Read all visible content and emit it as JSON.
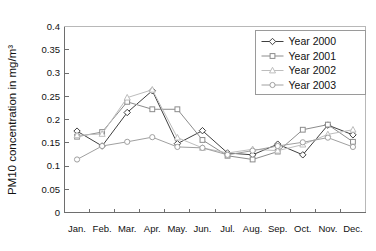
{
  "chart_data": {
    "type": "line",
    "title": "",
    "xlabel": "",
    "ylabel": "PM10 concentration in mg/m³",
    "categories": [
      "Jan.",
      "Feb.",
      "Mar.",
      "Apr.",
      "May.",
      "Jun.",
      "Jul.",
      "Aug.",
      "Sep.",
      "Oct.",
      "Nov.",
      "Dec."
    ],
    "ylim": [
      0,
      0.4
    ],
    "yticks": [
      0,
      0.05,
      0.1,
      0.15,
      0.2,
      0.25,
      0.3,
      0.35,
      0.4
    ],
    "ytick_labels": [
      "0",
      "0.05",
      "0.1",
      "0.15",
      "0.2",
      "0.25",
      "0.3",
      "0.35",
      "0.4"
    ],
    "grid": false,
    "legend_position": "top-right",
    "series": [
      {
        "name": "Year 2000",
        "marker": "diamond",
        "color": "#404040",
        "values": [
          0.175,
          0.143,
          0.215,
          0.262,
          0.148,
          0.176,
          0.128,
          0.124,
          0.147,
          0.124,
          0.188,
          0.167
        ]
      },
      {
        "name": "Year 2001",
        "marker": "square",
        "color": "#8c8c8c",
        "values": [
          0.163,
          0.173,
          0.238,
          0.222,
          0.222,
          0.156,
          0.122,
          0.114,
          0.131,
          0.178,
          0.189,
          0.152
        ]
      },
      {
        "name": "Year 2002",
        "marker": "triangle",
        "color": "#bdbdbd",
        "values": [
          0.166,
          0.169,
          0.247,
          0.264,
          0.161,
          0.139,
          0.128,
          0.136,
          0.133,
          0.146,
          0.168,
          0.178
        ]
      },
      {
        "name": "Year 2003",
        "marker": "circle",
        "color": "#a0a0a0",
        "values": [
          0.114,
          0.143,
          0.152,
          0.162,
          0.141,
          0.139,
          0.124,
          0.133,
          0.143,
          0.151,
          0.161,
          0.141
        ]
      }
    ]
  },
  "legend": {
    "items": [
      {
        "label": "Year 2000"
      },
      {
        "label": "Year 2001"
      },
      {
        "label": "Year 2002"
      },
      {
        "label": "Year 2003"
      }
    ]
  }
}
